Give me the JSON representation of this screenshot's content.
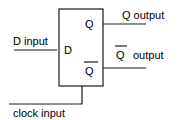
{
  "diagram": {
    "block": {
      "inner_labels": {
        "d": "D",
        "q": "Q",
        "q_bar": "Q"
      }
    },
    "signals": {
      "d_input": "D input",
      "q_output": "Q output",
      "q_bar_output_symbol": "Q",
      "q_bar_output_text": "output",
      "clock_input": "clock input"
    },
    "colors": {
      "line": "#1a1a1a",
      "background": "#ffffff"
    }
  }
}
